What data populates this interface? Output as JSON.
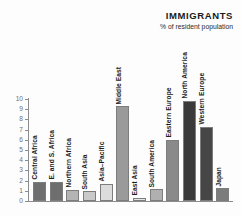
{
  "header": {
    "title": "IMMIGRANTS",
    "subtitle": "% of resident population"
  },
  "chart_data": {
    "type": "bar",
    "title": "IMMIGRANTS",
    "subtitle": "% of resident population",
    "xlabel": "",
    "ylabel": "",
    "ylim": [
      0,
      10
    ],
    "yticks": [
      0,
      1,
      2,
      3,
      4,
      5,
      6,
      7,
      8,
      9,
      10
    ],
    "ytick_labels": [
      "0",
      "1",
      "2",
      "3",
      "4",
      "5",
      "6",
      "7",
      "8",
      "9",
      "10"
    ],
    "grid": false,
    "legend": false,
    "categories": [
      "Central Africa",
      "E. and S. Africa",
      "Northern Africa",
      "South Asia",
      "Asia–Pacific",
      "Middle East",
      "East Asia",
      "South America",
      "Eastern Europe",
      "North America",
      "Western Europe",
      "Japan"
    ],
    "values": [
      1.9,
      1.9,
      1.1,
      0.95,
      1.7,
      9.3,
      0.3,
      1.15,
      6.0,
      9.8,
      7.3,
      1.25
    ],
    "bar_colors": [
      "#6e6e6e",
      "#6e6e6e",
      "#b4b4b4",
      "#c9c9c9",
      "#dcdcdc",
      "#9a9a9a",
      "#e4e4e4",
      "#b0b0b0",
      "#8a8a8a",
      "#3a3a3a",
      "#464646",
      "#7c7c7c"
    ],
    "label_placement": [
      "above",
      "above",
      "above",
      "above",
      "above",
      "above",
      "above",
      "above",
      "above",
      "above",
      "above",
      "above"
    ]
  },
  "colors": {
    "axis": "#8c8c8c",
    "tick_text": "#6f6f6f",
    "title_text": "#1a1a1a",
    "label_text": "#1c1c1c",
    "background": "#fdfdfd"
  }
}
